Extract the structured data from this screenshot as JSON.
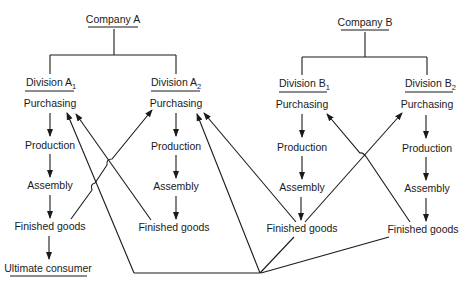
{
  "diagram": {
    "type": "flow",
    "companies": [
      {
        "label": "Company A",
        "divisions": [
          {
            "label": "Division A",
            "subscript": "1",
            "stages": [
              "Purchasing",
              "Production",
              "Assembly",
              "Finished goods"
            ],
            "final": "Ultimate consumer"
          },
          {
            "label": "Division A",
            "subscript": "2",
            "stages": [
              "Purchasing",
              "Production",
              "Assembly",
              "Finished goods"
            ]
          }
        ]
      },
      {
        "label": "Company B",
        "divisions": [
          {
            "label": "Division B",
            "subscript": "1",
            "stages": [
              "Purchasing",
              "Production",
              "Assembly",
              "Finished goods"
            ]
          },
          {
            "label": "Division B",
            "subscript": "2",
            "stages": [
              "Purchasing",
              "Production",
              "Assembly",
              "Finished goods"
            ]
          }
        ]
      }
    ],
    "flows": [
      {
        "from": "A1 Finished goods",
        "to": "A2 Purchasing"
      },
      {
        "from": "A2 Finished goods",
        "to": "A1 Purchasing"
      },
      {
        "from": "B1 Finished goods",
        "to": "A1 Purchasing (via bottom line)"
      },
      {
        "from": "B2 Finished goods",
        "to": "A1 Purchasing (via bottom line)"
      },
      {
        "from": "B1 Finished goods",
        "to": "A2 Purchasing"
      },
      {
        "from": "B1 Finished goods",
        "to": "B2 Purchasing"
      },
      {
        "from": "B2 Finished goods",
        "to": "B1 Purchasing"
      },
      {
        "from": "A1 Finished goods",
        "to": "Ultimate consumer"
      }
    ]
  }
}
